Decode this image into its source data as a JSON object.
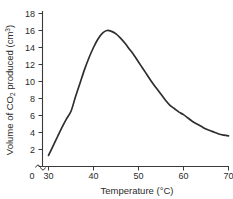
{
  "chart_data": {
    "type": "line",
    "title": "",
    "subtitle": "",
    "xlabel_parts": {
      "main": "Temperature (",
      "unit": "°C)"
    },
    "xlabel": "Temperature (°C)",
    "ylabel": "Volume of CO2 produced (cm3)",
    "ylabel_parts": {
      "pre": "Volume of CO",
      "sub": "2",
      "mid": " produced (cm",
      "sup": "3",
      "post": ")"
    },
    "xlim": [
      30,
      70
    ],
    "ylim": [
      0,
      18
    ],
    "x_ticks": [
      30,
      40,
      50,
      60,
      70
    ],
    "x_tick_labels": [
      "30",
      "40",
      "50",
      "60",
      "70"
    ],
    "x_origin_label": "0",
    "y_ticks": [
      0,
      2,
      4,
      6,
      8,
      10,
      12,
      14,
      16,
      18
    ],
    "y_tick_labels": [
      "0",
      "2",
      "4",
      "6",
      "8",
      "10",
      "12",
      "14",
      "16",
      "18"
    ],
    "axis_break": {
      "axis": "x",
      "present": true,
      "between": [
        0,
        30
      ]
    },
    "grid": false,
    "legend": false,
    "legend_position": "none",
    "line_color": "#2e2e2e",
    "axis_color": "#3a3a3a",
    "background_color": "#ffffff",
    "series": [
      {
        "name": "Volume of CO2 produced",
        "x": [
          30,
          31,
          32,
          33,
          34,
          35,
          36,
          37,
          38,
          39,
          40,
          41,
          42,
          43,
          44,
          45,
          46,
          47,
          48,
          49,
          50,
          51,
          52,
          53,
          54,
          55,
          56,
          57,
          58,
          59,
          60,
          61,
          62,
          63,
          64,
          65,
          66,
          67,
          68,
          69,
          70
        ],
        "values": [
          1.3,
          2.4,
          3.5,
          4.6,
          5.6,
          6.5,
          8.2,
          9.8,
          11.4,
          12.8,
          14.0,
          15.0,
          15.7,
          16.0,
          15.9,
          15.6,
          15.1,
          14.5,
          13.8,
          13.1,
          12.3,
          11.5,
          10.7,
          9.9,
          9.2,
          8.5,
          7.8,
          7.2,
          6.8,
          6.4,
          6.1,
          5.7,
          5.3,
          5.0,
          4.7,
          4.4,
          4.2,
          4.0,
          3.8,
          3.7,
          3.6
        ]
      }
    ],
    "peak": {
      "x": 43,
      "y": 16.0
    },
    "start_point": {
      "x": 30,
      "y": 1.3
    },
    "end_point": {
      "x": 70,
      "y": 3.6
    }
  }
}
